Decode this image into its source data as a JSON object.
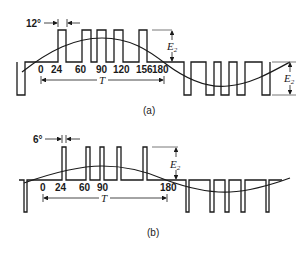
{
  "panel_a": {
    "caption": "(a)",
    "pulse_width_label": "12°",
    "tick_labels": [
      "0",
      "24",
      "60",
      "90",
      "120",
      "156",
      "180"
    ],
    "period_label": "T",
    "amplitude_label_pos": "E",
    "amplitude_label_pos_sub": "2",
    "amplitude_label_neg": "E",
    "amplitude_label_neg_sub": "2"
  },
  "panel_b": {
    "caption": "(b)",
    "pulse_width_label": "6°",
    "tick_labels": [
      "0",
      "24",
      "60",
      "90",
      "180"
    ],
    "period_label": "T",
    "amplitude_label_pos": "E",
    "amplitude_label_pos_sub": "2"
  }
}
